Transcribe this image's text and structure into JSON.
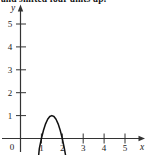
{
  "caption": {
    "text": "and shifted four units up."
  },
  "figure": {
    "name": "parabola-graph",
    "axis_color": "#333333",
    "curve_color": "#111111",
    "background": "#ffffff"
  },
  "axes": {
    "x_name": "x",
    "y_name": "y",
    "origin_label": "0",
    "x_ticks": [
      "1",
      "2",
      "3",
      "4",
      "5"
    ],
    "y_ticks": [
      "1",
      "2",
      "3",
      "4",
      "5"
    ]
  },
  "chart_data": {
    "type": "line",
    "title": "",
    "xlabel": "x",
    "ylabel": "y",
    "xlim": [
      0,
      5.6
    ],
    "ylim": [
      -0.6,
      5.6
    ],
    "grid": false,
    "legend": "none",
    "annotations": [
      "and shifted four units up."
    ],
    "x_tick_values": [
      0,
      1,
      2,
      3,
      4,
      5
    ],
    "y_tick_values": [
      0,
      1,
      2,
      3,
      4,
      5
    ],
    "series": [
      {
        "name": "parabola",
        "equation": "y = -4(x - 2)^2 + 4",
        "vertex": [
          2,
          4
        ],
        "x_intercepts": [
          1,
          3
        ],
        "opens": "down",
        "x": [
          0.85,
          0.9,
          1.0,
          1.1,
          1.2,
          1.3,
          1.4,
          1.5,
          1.6,
          1.7,
          1.8,
          1.9,
          2.0,
          2.1,
          2.2,
          2.3,
          2.4,
          2.5,
          2.6,
          2.7,
          2.8,
          2.9,
          3.0,
          3.1,
          3.15
        ],
        "y": [
          -0.9,
          -0.44,
          0.0,
          0.36,
          0.64,
          0.84,
          0.96,
          1.0,
          0.96,
          0.84,
          0.64,
          0.36,
          0.0,
          -0.44,
          -0.96,
          -1.56,
          -2.24,
          -3.0,
          -3.84,
          -4.76,
          -5.76,
          -6.84,
          -8.0,
          -9.24,
          -9.89
        ]
      }
    ]
  }
}
